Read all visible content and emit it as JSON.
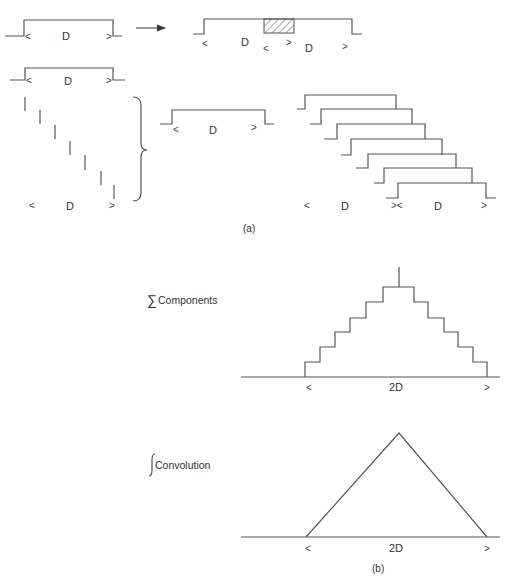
{
  "figure": {
    "panel_a": {
      "caption": "(a)",
      "pulse_width_label": "D",
      "left_marker": "<",
      "right_marker": ">",
      "joint_marker": "><",
      "top_row": {
        "single_pulse": {
          "label": "D"
        },
        "arrow": "arrow-right",
        "overlapped_pulses": {
          "labels": [
            "D",
            "D"
          ],
          "overlap": "hatched"
        }
      },
      "middle_row": {
        "reference_pulse": {
          "label": "D"
        },
        "impulse_count": 7,
        "impulse_span_label": "D",
        "result_pulse": {
          "label": "D"
        }
      },
      "staircase": {
        "pulse_count": 7,
        "labels": [
          "D",
          "D"
        ]
      }
    },
    "panel_b": {
      "caption": "(b)",
      "sum_label": "Components",
      "sum_symbol": "∑",
      "integral_label": "Convolution",
      "integral_symbol": "∫",
      "sum_plot": {
        "type": "staircase",
        "steps_each_side": 6,
        "width_label": "2D",
        "left_marker": "<",
        "right_marker": ">"
      },
      "integral_plot": {
        "type": "triangle",
        "width_label": "2D",
        "left_marker": "<",
        "right_marker": ">"
      }
    }
  }
}
